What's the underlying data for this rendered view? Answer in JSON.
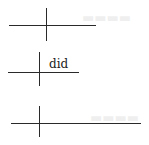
{
  "diagram": {
    "type": "sentence-diagram-baselines",
    "line_color": "#2a2a2a",
    "background": "#ffffff",
    "diagrams": [
      {
        "id": 1,
        "subject": "",
        "predicate": "",
        "baseline": {
          "x1": 9,
          "x2": 96,
          "y": 25
        },
        "divider": {
          "x": 46,
          "y1": 8,
          "y2": 41
        }
      },
      {
        "id": 2,
        "subject": "",
        "predicate": "did",
        "baseline": {
          "x1": 8,
          "x2": 79,
          "y": 72
        },
        "divider": {
          "x": 39,
          "y1": 52,
          "y2": 86
        }
      },
      {
        "id": 3,
        "subject": "",
        "predicate": "",
        "baseline": {
          "x1": 11,
          "x2": 141,
          "y": 123
        },
        "divider": {
          "x": 39,
          "y1": 106,
          "y2": 137
        }
      }
    ]
  }
}
